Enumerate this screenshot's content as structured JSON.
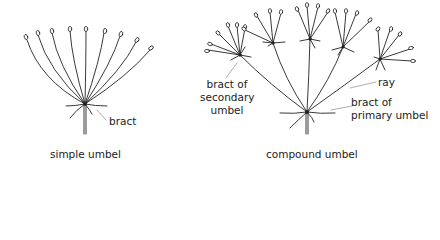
{
  "diagrams": [
    {
      "id": "simple",
      "caption": "simple umbel",
      "labels": {
        "bract": "bract"
      }
    },
    {
      "id": "compound",
      "caption": "compound umbel",
      "labels": {
        "bract_secondary_1": "bract of",
        "bract_secondary_2": "secondary",
        "bract_secondary_3": "umbel",
        "ray": "ray",
        "bract_primary_1": "bract of",
        "bract_primary_2": "primary umbel"
      }
    }
  ],
  "colors": {
    "line": "#222222",
    "leader": "#8a8a8a",
    "background": "#ffffff"
  }
}
